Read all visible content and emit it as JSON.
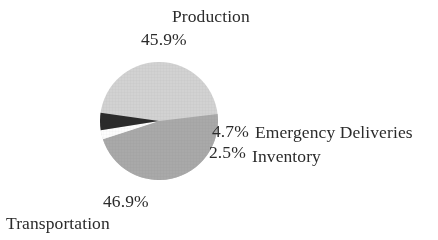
{
  "chart_data": {
    "type": "pie",
    "title": "",
    "labels": [
      "Production",
      "Transportation",
      "Emergency Deliveries",
      "Inventory"
    ],
    "values": [
      45.9,
      46.9,
      4.7,
      2.5
    ],
    "value_labels": [
      "45.9%",
      "46.9%",
      "4.7%",
      "2.5%"
    ],
    "units": "percent",
    "legend": "none",
    "grid": false,
    "slice_colors": [
      "#d2d2d2",
      "#a9a9a9",
      "#2b2b2b",
      "#fdfdfd"
    ],
    "start_angle_deg": 188,
    "direction": "clockwise",
    "label_placement": "outside-callout",
    "background": "#ffffff",
    "text_color": "#2b2b2b"
  },
  "labels": {
    "production": {
      "name": "Production",
      "pct": "45.9%"
    },
    "transportation": {
      "name": "Transportation",
      "pct": "46.9%"
    },
    "emergency": {
      "name": "Emergency Deliveries",
      "pct": "4.7%"
    },
    "inventory": {
      "name": "Inventory",
      "pct": "2.5%"
    }
  }
}
